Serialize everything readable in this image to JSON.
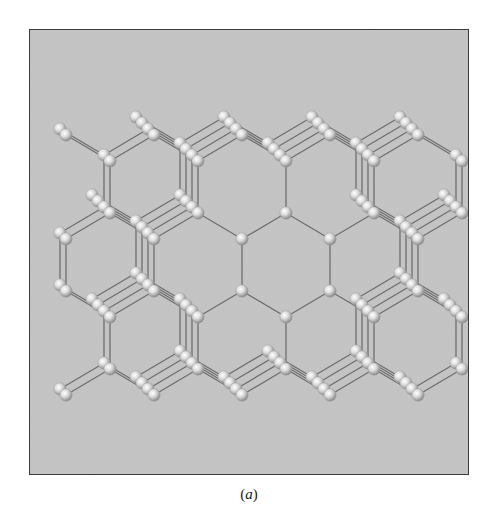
{
  "figure": {
    "caption_open": "(",
    "caption_label": "a",
    "caption_close": ")",
    "panel_background": "#c4c4c4",
    "panel_border": "#3a3a3a",
    "atom_color": "#e6e6e6",
    "atom_shadow": "#8a8a8a",
    "bond_color": "#6e6e6e"
  },
  "lattice": {
    "description": "Ball-and-stick model of a diamond-cubic crystal viewed along a <110> axis, showing hexagonal channels",
    "center_hexagon": [
      [
        241,
        238
      ],
      [
        285,
        212
      ],
      [
        329,
        238
      ],
      [
        329,
        290
      ],
      [
        285,
        316
      ],
      [
        241,
        290
      ]
    ],
    "depth_layers": 4,
    "depth_offset": [
      -6,
      -6
    ]
  }
}
